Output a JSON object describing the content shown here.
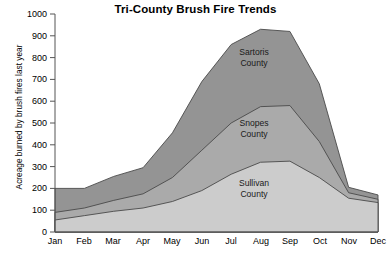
{
  "chart_data": {
    "type": "area",
    "stacked": true,
    "title": "Tri-County Brush Fire Trends",
    "xlabel": "",
    "ylabel": "Acreage burned by brush fires last year",
    "categories": [
      "Jan",
      "Feb",
      "Mar",
      "Apr",
      "May",
      "Jun",
      "Jul",
      "Aug",
      "Sep",
      "Oct",
      "Nov",
      "Dec"
    ],
    "ylim": [
      0,
      1000
    ],
    "ytick_labels": [
      "0",
      "100",
      "200",
      "300",
      "400",
      "500",
      "600",
      "700",
      "800",
      "900",
      "1000"
    ],
    "ytick_values": [
      0,
      100,
      200,
      300,
      400,
      500,
      600,
      700,
      800,
      900,
      1000
    ],
    "grid": false,
    "legend_position": "inline-labels",
    "series": [
      {
        "name": "Sullivan County",
        "label": "Sullivan\nCounty",
        "label_line1": "Sullivan",
        "label_line2": "County",
        "color": "#cccccc",
        "values": [
          55,
          75,
          95,
          110,
          140,
          190,
          265,
          320,
          325,
          250,
          155,
          135
        ]
      },
      {
        "name": "Snopes County",
        "label": "Snopes\nCounty",
        "label_line1": "Snopes",
        "label_line2": "County",
        "color": "#aaaaaa",
        "values": [
          90,
          110,
          145,
          175,
          250,
          375,
          500,
          575,
          580,
          415,
          180,
          150
        ]
      },
      {
        "name": "Sartoris County",
        "label": "Sartoris\nCounty",
        "label_line1": "Sartoris",
        "label_line2": "County",
        "color": "#949494",
        "values": [
          200,
          200,
          255,
          295,
          455,
          690,
          860,
          930,
          920,
          680,
          205,
          170
        ]
      }
    ],
    "colors": {
      "sullivan": "#cccccc",
      "snopes": "#aaaaaa",
      "sartoris": "#949494",
      "axis": "#555555",
      "outline": "#4a4a4a",
      "background": "#ffffff"
    }
  }
}
